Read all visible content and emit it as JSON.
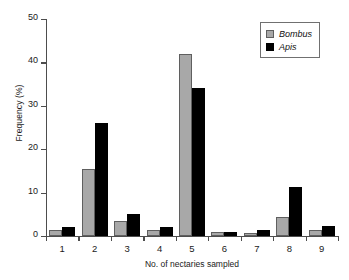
{
  "chart_data": {
    "type": "bar",
    "title": "",
    "xlabel": "No. of nectaries sampled",
    "ylabel": "Frequency (%)",
    "categories": [
      "1",
      "2",
      "3",
      "4",
      "5",
      "6",
      "7",
      "8",
      "9"
    ],
    "series": [
      {
        "name": "Bombus",
        "color": "#a8a8a8",
        "values": [
          1.5,
          15.5,
          3.4,
          1.3,
          42.0,
          0.9,
          0.7,
          4.4,
          1.4
        ]
      },
      {
        "name": "Apis",
        "color": "#000000",
        "values": [
          2.0,
          26.0,
          5.0,
          2.1,
          34.0,
          0.9,
          1.3,
          11.3,
          2.2
        ]
      }
    ],
    "yticks": [
      0,
      10,
      20,
      30,
      40,
      50
    ],
    "ylim": [
      0,
      50
    ],
    "grid": false,
    "legend_position": "top-right"
  },
  "legend": {
    "entries": [
      {
        "label": "Bombus",
        "swatch": "gray-square-swatch"
      },
      {
        "label": "Apis",
        "swatch": "black-square-swatch"
      }
    ]
  }
}
